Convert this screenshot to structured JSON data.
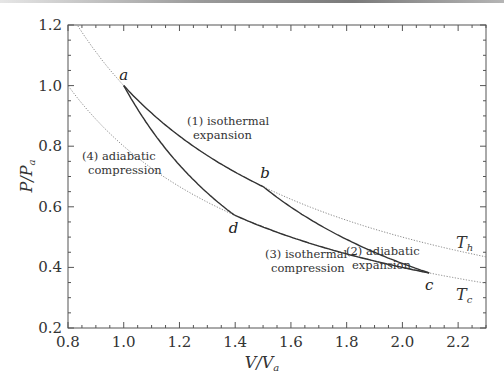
{
  "chart_data": {
    "type": "line",
    "title": "",
    "xlabel": "V/V_a",
    "ylabel": "P/P_a",
    "xlim": [
      0.8,
      2.3
    ],
    "ylim": [
      0.2,
      1.2
    ],
    "grid": false,
    "x_ticks": [
      "0.8",
      "1.0",
      "1.2",
      "1.4",
      "1.6",
      "1.8",
      "2.0",
      "2.2"
    ],
    "y_ticks": [
      "0.2",
      "0.4",
      "0.6",
      "0.8",
      "1.0",
      "1.2"
    ],
    "gamma": 1.6667,
    "isotherms": [
      {
        "name": "T_h",
        "label_main": "T",
        "label_sub": "h",
        "pv_constant": 1.0,
        "style": "dotted"
      },
      {
        "name": "T_c",
        "label_main": "T",
        "label_sub": "c",
        "pv_constant": 0.8,
        "style": "dotted"
      }
    ],
    "points": [
      {
        "name": "a",
        "V": 1.0,
        "P": 1.0
      },
      {
        "name": "b",
        "V": 1.5,
        "P": 0.667
      },
      {
        "name": "c",
        "V": 2.096,
        "P": 0.382
      },
      {
        "name": "d",
        "V": 1.398,
        "P": 0.572
      }
    ],
    "series": [
      {
        "name": "(1) isothermal expansion",
        "from": "a",
        "to": "b",
        "kind": "isotherm",
        "pv_constant": 1.0
      },
      {
        "name": "(2) adiabatic expansion",
        "from": "b",
        "to": "c",
        "kind": "adiabat"
      },
      {
        "name": "(3) isothermal compression",
        "from": "c",
        "to": "d",
        "kind": "isotherm",
        "pv_constant": 0.8
      },
      {
        "name": "(4) adiabatic compression",
        "from": "d",
        "to": "a",
        "kind": "adiabat"
      }
    ],
    "annotations": [
      {
        "lines": [
          "(1) isothermal",
          "expansion"
        ],
        "x": 187,
        "y": 125
      },
      {
        "lines": [
          "(2) adiabatic",
          "expansion"
        ],
        "x": 346,
        "y": 255
      },
      {
        "lines": [
          "(3) isothermal",
          "compression"
        ],
        "x": 265,
        "y": 258
      },
      {
        "lines": [
          "(4) adiabatic",
          "compression"
        ],
        "x": 82,
        "y": 160
      }
    ]
  }
}
